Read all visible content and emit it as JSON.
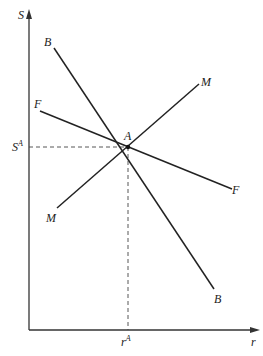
{
  "diagram": {
    "type": "line-intersection-diagram",
    "axes": {
      "y_label": "S",
      "x_label": "r"
    },
    "curves": [
      {
        "id": "BB",
        "start_label": "B",
        "end_label": "B",
        "slope": "negative-steep"
      },
      {
        "id": "FF",
        "start_label": "F",
        "end_label": "F",
        "slope": "negative-shallow"
      },
      {
        "id": "MM",
        "start_label": "M",
        "end_label": "M",
        "slope": "positive"
      }
    ],
    "intersection": {
      "label": "A",
      "y_value_label": {
        "base": "S",
        "sup": "A"
      },
      "x_value_label": {
        "base": "r",
        "sup": "A"
      }
    },
    "labels": {
      "b_top": "B",
      "b_bottom": "B",
      "f_left": "F",
      "f_right": "F",
      "m_top": "M",
      "m_bottom": "M",
      "point_a": "A",
      "s_a_base": "S",
      "s_a_sup": "A",
      "r_a_base": "r",
      "r_a_sup": "A",
      "y_axis": "S",
      "x_axis": "r"
    },
    "colors": {
      "line": "#222222",
      "background": "#ffffff"
    }
  }
}
